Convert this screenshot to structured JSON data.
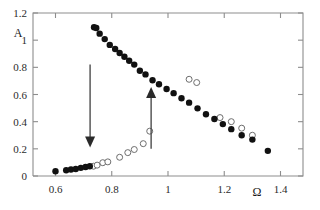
{
  "chart_data": {
    "type": "scatter",
    "title": "",
    "xlabel": "Ω",
    "ylabel": "A",
    "xlim": [
      0.52,
      1.48
    ],
    "ylim": [
      0.0,
      1.2
    ],
    "grid": false,
    "legend_position": "none",
    "xticks": [
      "0.6",
      "0.8",
      "1",
      "1.2",
      "1.4"
    ],
    "xtick_values": [
      0.6,
      0.8,
      1.0,
      1.2,
      1.4
    ],
    "yticks": [
      "0",
      "0.2",
      "0.4",
      "0.6",
      "0.8",
      "1",
      "1.2"
    ],
    "ytick_values": [
      0,
      0.2,
      0.4,
      0.6,
      0.8,
      1.0,
      1.2
    ],
    "series": [
      {
        "name": "filled-circles",
        "marker": "filled circle",
        "color": "#111111",
        "x": [
          0.6,
          0.638,
          0.655,
          0.672,
          0.69,
          0.707,
          0.722,
          0.737,
          0.745,
          0.757,
          0.775,
          0.793,
          0.812,
          0.828,
          0.845,
          0.862,
          0.88,
          0.9,
          0.92,
          0.945,
          0.968,
          0.995,
          1.02,
          1.048,
          1.075,
          1.105,
          1.135,
          1.165,
          1.195,
          1.225,
          1.262,
          1.3,
          1.355
        ],
        "y": [
          0.035,
          0.042,
          0.048,
          0.052,
          0.06,
          0.066,
          0.072,
          1.095,
          1.09,
          1.048,
          1.008,
          0.965,
          0.935,
          0.905,
          0.878,
          0.848,
          0.82,
          0.775,
          0.748,
          0.705,
          0.675,
          0.64,
          0.61,
          0.572,
          0.54,
          0.498,
          0.455,
          0.42,
          0.382,
          0.345,
          0.3,
          0.268,
          0.185
        ]
      },
      {
        "name": "hollow-circles",
        "marker": "open circle",
        "color": "#6e6e6e",
        "x": [
          0.735,
          0.748,
          0.768,
          0.786,
          0.828,
          0.857,
          0.88,
          0.912,
          0.935,
          1.075,
          1.102,
          1.185,
          1.225,
          1.262,
          1.3
        ],
        "y": [
          0.072,
          0.08,
          0.098,
          0.104,
          0.138,
          0.172,
          0.195,
          0.238,
          0.33,
          0.712,
          0.688,
          0.43,
          0.4,
          0.352,
          0.3
        ]
      }
    ],
    "annotations": [
      {
        "name": "down-arrow",
        "type": "arrow",
        "direction": "down",
        "x": 0.723,
        "y_start": 0.82,
        "y_end": 0.21
      },
      {
        "name": "up-arrow",
        "type": "arrow",
        "direction": "up",
        "x": 0.94,
        "y_start": 0.2,
        "y_end": 0.655
      }
    ]
  },
  "axes": {
    "y_axis_title": "A",
    "x_axis_title": "Ω"
  }
}
